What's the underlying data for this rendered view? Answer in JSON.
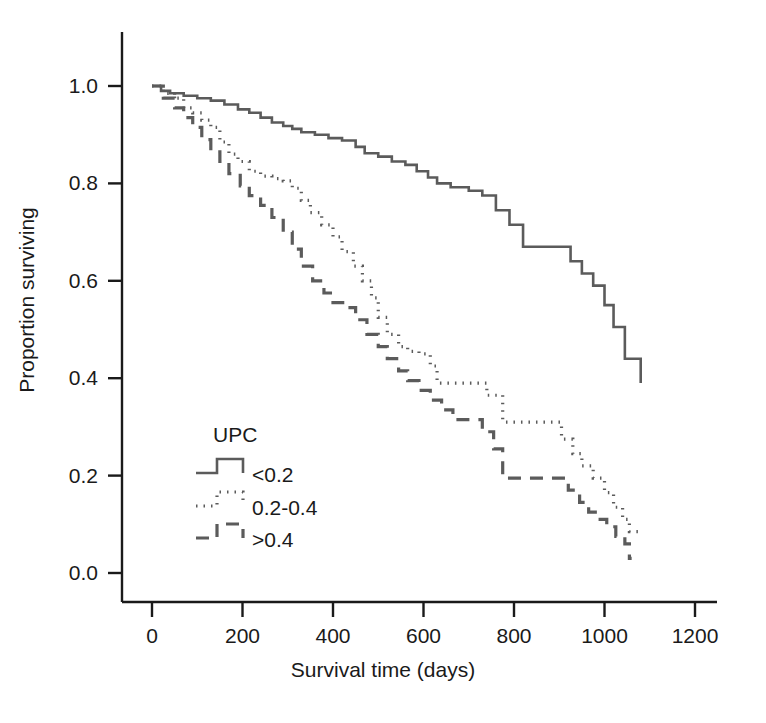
{
  "chart_data": {
    "type": "line",
    "title": "",
    "subtitle": "",
    "xlabel": "Survival time (days)",
    "ylabel": "Proportion surviving",
    "xlim": [
      -30,
      1250
    ],
    "ylim": [
      0.0,
      1.05
    ],
    "xticks": [
      0,
      200,
      400,
      600,
      800,
      1000,
      1200
    ],
    "xticklabels": [
      "0",
      "200",
      "400",
      "600",
      "800",
      "1000",
      "1200"
    ],
    "yticks": [
      0.0,
      0.2,
      0.4,
      0.6,
      0.8,
      1.0
    ],
    "yticklabels": [
      "0.0",
      "0.2",
      "0.4",
      "0.6",
      "0.8",
      "1.0"
    ],
    "grid": false,
    "legend_position": "lower-left-inside",
    "legend_title": "UPC",
    "line_color": "#5b5b5b",
    "axis_color": "#1a1a1a",
    "series": [
      {
        "name": "<0.2",
        "label": "<0.2",
        "linestyle": "solid",
        "color": "#5b5b5b",
        "points": [
          [
            0,
            1.0
          ],
          [
            20,
            0.99
          ],
          [
            40,
            0.985
          ],
          [
            70,
            0.98
          ],
          [
            100,
            0.975
          ],
          [
            130,
            0.97
          ],
          [
            160,
            0.962
          ],
          [
            190,
            0.952
          ],
          [
            215,
            0.945
          ],
          [
            240,
            0.935
          ],
          [
            265,
            0.925
          ],
          [
            290,
            0.918
          ],
          [
            310,
            0.912
          ],
          [
            330,
            0.905
          ],
          [
            360,
            0.9
          ],
          [
            390,
            0.893
          ],
          [
            420,
            0.888
          ],
          [
            450,
            0.875
          ],
          [
            470,
            0.862
          ],
          [
            500,
            0.855
          ],
          [
            530,
            0.845
          ],
          [
            560,
            0.838
          ],
          [
            585,
            0.825
          ],
          [
            610,
            0.812
          ],
          [
            630,
            0.8
          ],
          [
            660,
            0.792
          ],
          [
            700,
            0.785
          ],
          [
            730,
            0.775
          ],
          [
            760,
            0.745
          ],
          [
            790,
            0.715
          ],
          [
            820,
            0.67
          ],
          [
            900,
            0.67
          ],
          [
            925,
            0.64
          ],
          [
            950,
            0.615
          ],
          [
            975,
            0.59
          ],
          [
            1000,
            0.55
          ],
          [
            1020,
            0.505
          ],
          [
            1045,
            0.44
          ],
          [
            1080,
            0.44
          ],
          [
            1080,
            0.39
          ]
        ]
      },
      {
        "name": "0.2-0.4",
        "label": "0.2-0.4",
        "linestyle": "dotted",
        "color": "#5b5b5b",
        "points": [
          [
            0,
            1.0
          ],
          [
            25,
            0.985
          ],
          [
            50,
            0.975
          ],
          [
            70,
            0.955
          ],
          [
            90,
            0.945
          ],
          [
            110,
            0.93
          ],
          [
            130,
            0.915
          ],
          [
            150,
            0.885
          ],
          [
            170,
            0.86
          ],
          [
            190,
            0.845
          ],
          [
            215,
            0.825
          ],
          [
            240,
            0.815
          ],
          [
            265,
            0.81
          ],
          [
            290,
            0.805
          ],
          [
            310,
            0.79
          ],
          [
            330,
            0.765
          ],
          [
            350,
            0.74
          ],
          [
            375,
            0.715
          ],
          [
            400,
            0.69
          ],
          [
            420,
            0.66
          ],
          [
            445,
            0.63
          ],
          [
            465,
            0.6
          ],
          [
            485,
            0.565
          ],
          [
            500,
            0.525
          ],
          [
            520,
            0.49
          ],
          [
            545,
            0.465
          ],
          [
            565,
            0.455
          ],
          [
            590,
            0.45
          ],
          [
            615,
            0.425
          ],
          [
            630,
            0.39
          ],
          [
            660,
            0.39
          ],
          [
            700,
            0.39
          ],
          [
            740,
            0.365
          ],
          [
            775,
            0.31
          ],
          [
            880,
            0.31
          ],
          [
            905,
            0.275
          ],
          [
            930,
            0.245
          ],
          [
            950,
            0.22
          ],
          [
            975,
            0.195
          ],
          [
            1000,
            0.165
          ],
          [
            1020,
            0.135
          ],
          [
            1040,
            0.11
          ],
          [
            1055,
            0.085
          ],
          [
            1080,
            0.085
          ]
        ]
      },
      {
        "name": ">0.4",
        "label": ">0.4",
        "linestyle": "dashed",
        "color": "#5b5b5b",
        "points": [
          [
            0,
            1.0
          ],
          [
            25,
            0.975
          ],
          [
            50,
            0.955
          ],
          [
            70,
            0.935
          ],
          [
            90,
            0.915
          ],
          [
            110,
            0.89
          ],
          [
            130,
            0.865
          ],
          [
            150,
            0.845
          ],
          [
            170,
            0.82
          ],
          [
            195,
            0.795
          ],
          [
            215,
            0.775
          ],
          [
            240,
            0.755
          ],
          [
            265,
            0.73
          ],
          [
            290,
            0.7
          ],
          [
            310,
            0.665
          ],
          [
            330,
            0.63
          ],
          [
            355,
            0.6
          ],
          [
            380,
            0.575
          ],
          [
            400,
            0.555
          ],
          [
            425,
            0.545
          ],
          [
            450,
            0.52
          ],
          [
            475,
            0.49
          ],
          [
            500,
            0.465
          ],
          [
            520,
            0.44
          ],
          [
            545,
            0.415
          ],
          [
            565,
            0.395
          ],
          [
            590,
            0.375
          ],
          [
            615,
            0.355
          ],
          [
            640,
            0.335
          ],
          [
            665,
            0.315
          ],
          [
            700,
            0.315
          ],
          [
            730,
            0.29
          ],
          [
            755,
            0.255
          ],
          [
            775,
            0.195
          ],
          [
            890,
            0.195
          ],
          [
            920,
            0.17
          ],
          [
            945,
            0.145
          ],
          [
            965,
            0.125
          ],
          [
            985,
            0.11
          ],
          [
            1005,
            0.095
          ],
          [
            1025,
            0.075
          ],
          [
            1045,
            0.06
          ],
          [
            1055,
            0.03
          ],
          [
            1060,
            0.03
          ]
        ]
      }
    ]
  },
  "legend": {
    "title": "UPC",
    "entries": [
      {
        "label": "<0.2",
        "style": "solid"
      },
      {
        "label": "0.2-0.4",
        "style": "dotted"
      },
      {
        "label": ">0.4",
        "style": "dashed"
      }
    ]
  },
  "axes": {
    "x_title": "Survival time (days)",
    "y_title": "Proportion surviving",
    "x_tick_labels": [
      "0",
      "200",
      "400",
      "600",
      "800",
      "1000",
      "1200"
    ],
    "y_tick_labels": [
      "0.0",
      "0.2",
      "0.4",
      "0.6",
      "0.8",
      "1.0"
    ]
  }
}
